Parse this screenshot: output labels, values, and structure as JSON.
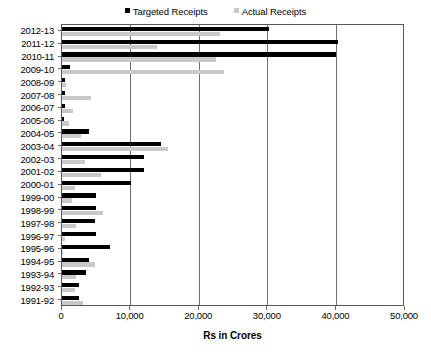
{
  "chart_data": {
    "type": "bar",
    "orientation": "horizontal",
    "title": "",
    "xlabel": "Rs in Crores",
    "ylabel": "",
    "xlim": [
      0,
      50000
    ],
    "xticks": [
      0,
      10000,
      20000,
      30000,
      40000,
      50000
    ],
    "xticklabels": [
      "0",
      "10,000",
      "20,000",
      "30,000",
      "40,000",
      "50,000"
    ],
    "grid": true,
    "legend_position": "top-center",
    "categories": [
      "2012-13",
      "2011-12",
      "2010-11",
      "2009-10",
      "2008-09",
      "2007-08",
      "2006-07",
      "2005-06",
      "2004-05",
      "2003-04",
      "2002-03",
      "2001-02",
      "2000-01",
      "1999-00",
      "1998-99",
      "1997-98",
      "1996-97",
      "1995-96",
      "1994-95",
      "1993-94",
      "1992-93",
      "1991-92"
    ],
    "series": [
      {
        "name": "Targeted Receipts",
        "color": "#000000",
        "values": [
          30200,
          40300,
          40000,
          1120,
          500,
          420,
          380,
          350,
          4000,
          14500,
          12000,
          12000,
          10000,
          5000,
          5000,
          4800,
          5000,
          7000,
          4000,
          3500,
          2500,
          2500
        ]
      },
      {
        "name": "Actual Receipts",
        "color": "#c9c9c9",
        "values": [
          23000,
          13900,
          22500,
          23600,
          560,
          4180,
          1570,
          1000,
          2760,
          15500,
          3360,
          5630,
          1870,
          1500,
          6000,
          2000,
          380,
          170,
          4840,
          2000,
          1960,
          3000
        ]
      }
    ]
  },
  "legend": {
    "entries": [
      {
        "label": "Targeted Receipts",
        "swatch": "legend-swatch-black"
      },
      {
        "label": "Actual Receipts",
        "swatch": "legend-swatch-gray"
      }
    ]
  },
  "axis": {
    "x_title": "Rs in Crores"
  },
  "colors": {
    "targeted": "#000000",
    "actual": "#c9c9c9",
    "frame": "#5a5a5a",
    "grid": "#6e6e6e",
    "background": "#ffffff"
  }
}
